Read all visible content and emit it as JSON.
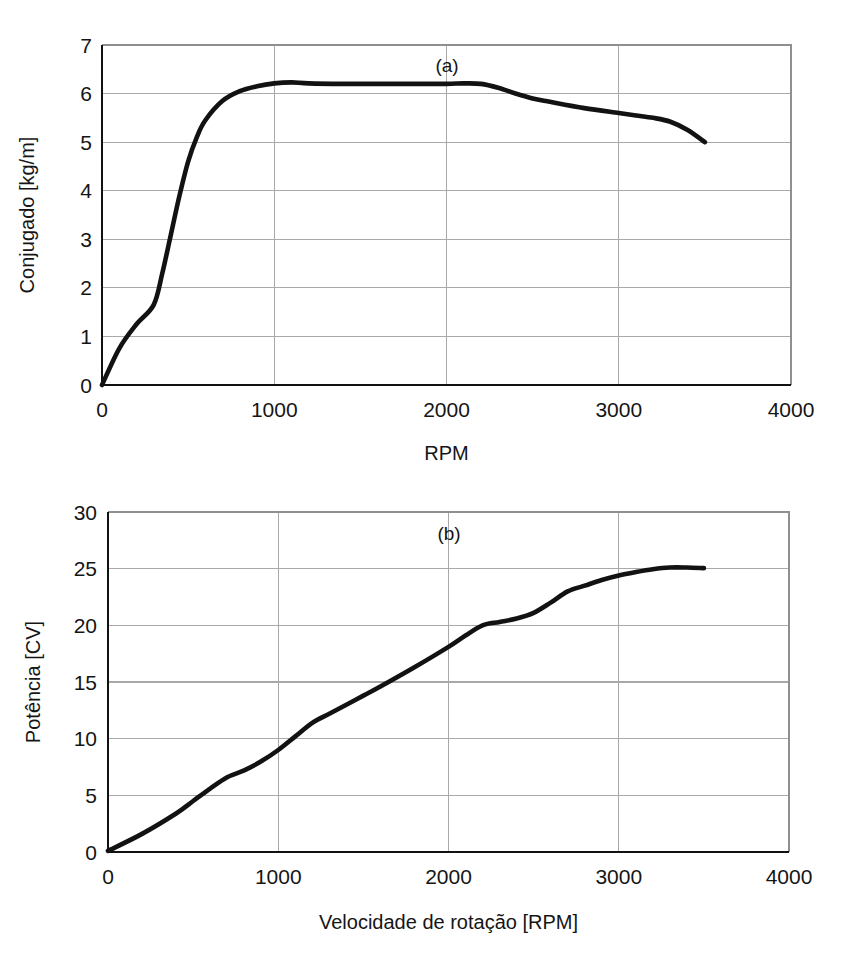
{
  "figure": {
    "background": "#ffffff",
    "curve_color": "#121212",
    "grid_color": "#a9a9a9",
    "axis_color": "#111111",
    "panel_count": 2
  },
  "chart_data": [
    {
      "type": "line",
      "panel_tag": "(a)",
      "title": "",
      "subtitle": "",
      "xlabel": "RPM",
      "ylabel": "Conjugado [kg/m]",
      "xlim": [
        0,
        4000
      ],
      "ylim": [
        0,
        7
      ],
      "xticks": [
        0,
        1000,
        2000,
        3000,
        4000
      ],
      "yticks": [
        0,
        1,
        2,
        3,
        4,
        5,
        6,
        7
      ],
      "xtick_labels": [
        "0",
        "1000",
        "2000",
        "3000",
        "4000"
      ],
      "ytick_labels": [
        "0",
        "1",
        "2",
        "3",
        "4",
        "5",
        "6",
        "7"
      ],
      "grid": true,
      "legend": null,
      "annotations": [
        "(a)"
      ],
      "series": [
        {
          "name": "Conjugado",
          "x": [
            0,
            100,
            200,
            300,
            350,
            400,
            450,
            500,
            550,
            600,
            700,
            800,
            900,
            1000,
            1100,
            1200,
            1400,
            1600,
            1800,
            2000,
            2100,
            2200,
            2300,
            2400,
            2500,
            2600,
            2800,
            3000,
            3100,
            3200,
            3300,
            3400,
            3500
          ],
          "y": [
            0.0,
            0.75,
            1.25,
            1.65,
            2.3,
            3.1,
            3.9,
            4.6,
            5.1,
            5.45,
            5.85,
            6.05,
            6.15,
            6.21,
            6.23,
            6.21,
            6.2,
            6.2,
            6.2,
            6.2,
            6.21,
            6.2,
            6.12,
            6.0,
            5.9,
            5.83,
            5.7,
            5.6,
            5.55,
            5.5,
            5.42,
            5.25,
            5.0
          ]
        }
      ]
    },
    {
      "type": "line",
      "panel_tag": "(b)",
      "title": "",
      "subtitle": "",
      "xlabel": "Velocidade de rotação [RPM]",
      "ylabel": "Potência [CV]",
      "xlim": [
        0,
        4000
      ],
      "ylim": [
        0,
        30
      ],
      "xticks": [
        0,
        1000,
        2000,
        3000,
        4000
      ],
      "yticks": [
        0,
        5,
        10,
        15,
        20,
        25,
        30
      ],
      "xtick_labels": [
        "0",
        "1000",
        "2000",
        "3000",
        "4000"
      ],
      "ytick_labels": [
        "0",
        "5",
        "10",
        "15",
        "20",
        "25",
        "30"
      ],
      "grid": true,
      "legend": null,
      "annotations": [
        "(b)"
      ],
      "series": [
        {
          "name": "Potência",
          "x": [
            0,
            200,
            400,
            500,
            600,
            700,
            800,
            900,
            1000,
            1100,
            1200,
            1300,
            1400,
            1500,
            1600,
            1800,
            2000,
            2100,
            2200,
            2300,
            2400,
            2500,
            2600,
            2700,
            2800,
            2900,
            3000,
            3100,
            3200,
            3300,
            3400,
            3500
          ],
          "y": [
            0.1,
            1.6,
            3.4,
            4.5,
            5.6,
            6.6,
            7.2,
            8.0,
            9.0,
            10.2,
            11.4,
            12.2,
            13.0,
            13.8,
            14.6,
            16.3,
            18.1,
            19.1,
            20.0,
            20.3,
            20.6,
            21.1,
            22.0,
            23.0,
            23.5,
            24.0,
            24.4,
            24.7,
            24.95,
            25.1,
            25.1,
            25.05
          ]
        }
      ]
    }
  ]
}
